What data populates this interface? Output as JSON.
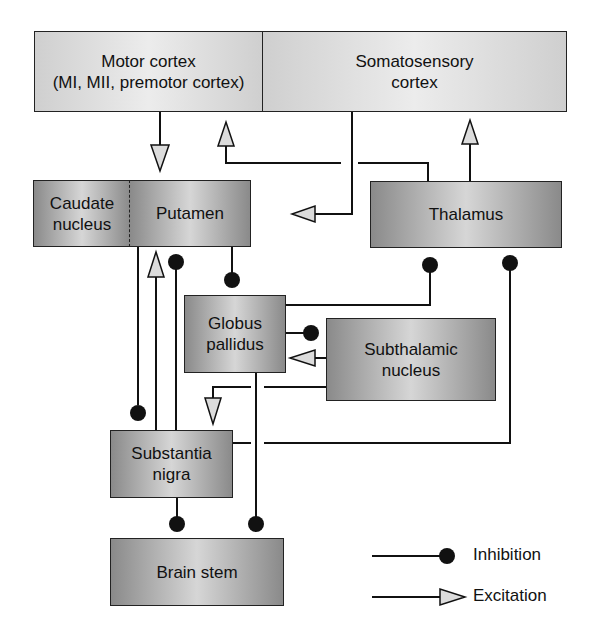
{
  "diagram": {
    "nodes": {
      "motor_cortex": "Motor cortex\n(MI, MII, premotor cortex)",
      "somatosensory_cortex": "Somatosensory\ncortex",
      "caudate_nucleus": "Caudate\nnucleus",
      "putamen": "Putamen",
      "thalamus": "Thalamus",
      "globus_pallidus": "Globus\npallidus",
      "subthalamic_nucleus": "Subthalamic\nnucleus",
      "substantia_nigra": "Substantia\nnigra",
      "brain_stem": "Brain stem"
    },
    "connections": [
      {
        "from": "Motor cortex",
        "to": "Putamen",
        "type": "excitation"
      },
      {
        "from": "Thalamus",
        "to": "Motor cortex",
        "type": "excitation"
      },
      {
        "from": "Thalamus",
        "to": "Somatosensory cortex",
        "type": "excitation"
      },
      {
        "from": "Somatosensory cortex",
        "to": "Putamen",
        "type": "excitation"
      },
      {
        "from": "Putamen",
        "to": "Globus pallidus",
        "type": "inhibition"
      },
      {
        "from": "Globus pallidus",
        "to": "Thalamus",
        "type": "inhibition"
      },
      {
        "from": "Globus pallidus",
        "to": "Subthalamic nucleus",
        "type": "inhibition"
      },
      {
        "from": "Subthalamic nucleus",
        "to": "Globus pallidus",
        "type": "excitation"
      },
      {
        "from": "Subthalamic nucleus",
        "to": "Substantia nigra",
        "type": "excitation"
      },
      {
        "from": "Caudate nucleus",
        "to": "Substantia nigra",
        "type": "inhibition"
      },
      {
        "from": "Substantia nigra",
        "to": "Putamen",
        "type": "excitation"
      },
      {
        "from": "Substantia nigra",
        "to": "Putamen",
        "type": "inhibition"
      },
      {
        "from": "Substantia nigra",
        "to": "Thalamus",
        "type": "inhibition"
      },
      {
        "from": "Substantia nigra",
        "to": "Brain stem",
        "type": "inhibition"
      },
      {
        "from": "Globus pallidus",
        "to": "Brain stem",
        "type": "inhibition"
      }
    ]
  },
  "legend": {
    "inhibition": "Inhibition",
    "excitation": "Excitation"
  },
  "colors": {
    "line": "#111111",
    "arrow_fill": "#dcdcdc",
    "cortex_fill": "#e0e0e0",
    "nucleus_fill": "#a8a8a8"
  }
}
